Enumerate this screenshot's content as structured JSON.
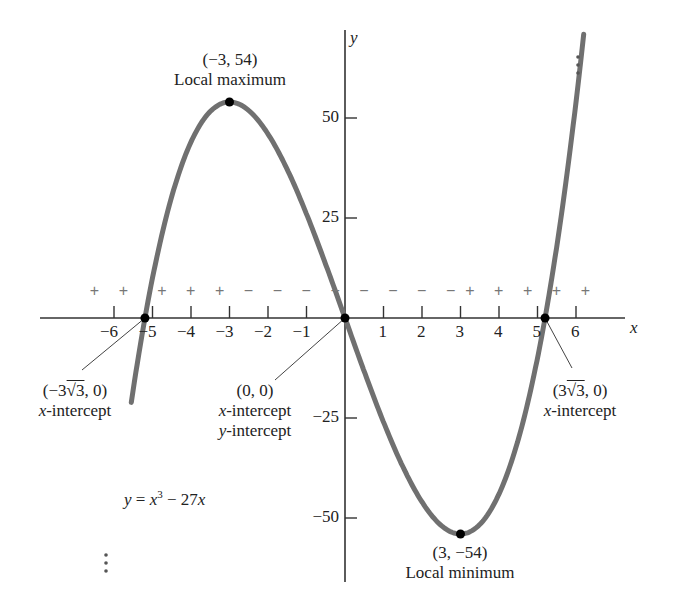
{
  "chart_data": {
    "type": "line",
    "title": "",
    "equation": "y = x³ − 27x",
    "xlabel": "x",
    "ylabel": "y",
    "xlim": [
      -7.9,
      7.6
    ],
    "ylim": [
      -66,
      72
    ],
    "x_ticks": [
      -6,
      -5,
      -4,
      -3,
      -2,
      -1,
      1,
      2,
      3,
      4,
      5,
      6
    ],
    "x_tick_labels": [
      "−6",
      "−5",
      "−4",
      "−3",
      "−2",
      "−1",
      "1",
      "2",
      "3",
      "4",
      "5",
      "6"
    ],
    "y_ticks": [
      50,
      25,
      -25,
      -50
    ],
    "y_tick_labels": [
      "50",
      "25",
      "−25",
      "−50"
    ],
    "series": [
      {
        "name": "y = x^3 - 27x",
        "function": "x^3 - 27x",
        "x_range": [
          -5.55,
          6.2
        ],
        "color": "#707070"
      }
    ],
    "points": [
      {
        "x": -3,
        "y": 54,
        "label": "(−3, 54)",
        "note": "Local maximum"
      },
      {
        "x": 3,
        "y": -54,
        "label": "(3, −54)",
        "note": "Local minimum"
      },
      {
        "x": -5.196,
        "y": 0,
        "label": "(−3√3, 0)",
        "note": "x-intercept"
      },
      {
        "x": 0,
        "y": 0,
        "label": "(0, 0)",
        "note": "x-intercept y-intercept"
      },
      {
        "x": 5.196,
        "y": 0,
        "label": "(3√3, 0)",
        "note": "x-intercept"
      }
    ],
    "sign_chart": {
      "positions": [
        -6.5,
        -5.75,
        -4.75,
        -4,
        -3.25,
        -2.5,
        -1.75,
        -1,
        -0.25,
        0.5,
        1.25,
        2,
        2.75,
        3.25,
        4,
        4.75,
        5.5,
        6.25
      ],
      "signs": [
        "+",
        "+",
        "+",
        "+",
        "+",
        "−",
        "−",
        "−",
        "−",
        "−",
        "−",
        "−",
        "−",
        "+",
        "+",
        "+",
        "+",
        "+"
      ]
    },
    "grid": false,
    "legend": null
  },
  "labels": {
    "max_coord": "(−3, 54)",
    "max_note": "Local maximum",
    "min_coord": "(3, −54)",
    "min_note": "Local minimum",
    "left_int_coord_a": "(−3",
    "left_int_coord_root": "√3",
    "left_int_coord_b": ", 0)",
    "left_int_note_var": "x",
    "left_int_note": "-intercept",
    "origin_coord": "(0, 0)",
    "origin_note1_var": "x",
    "origin_note1": "-intercept",
    "origin_note2_var": "y",
    "origin_note2": "-intercept",
    "right_int_coord_a": "(3",
    "right_int_coord_root": "√3",
    "right_int_coord_b": ", 0)",
    "right_int_note_var": "x",
    "right_int_note": "-intercept",
    "eq_y": "y",
    "eq_eq": " = ",
    "eq_x": "x",
    "eq_sup": "3",
    "eq_rest": " − 27",
    "eq_x2": "x",
    "x_axis": "x",
    "y_axis": "y"
  }
}
